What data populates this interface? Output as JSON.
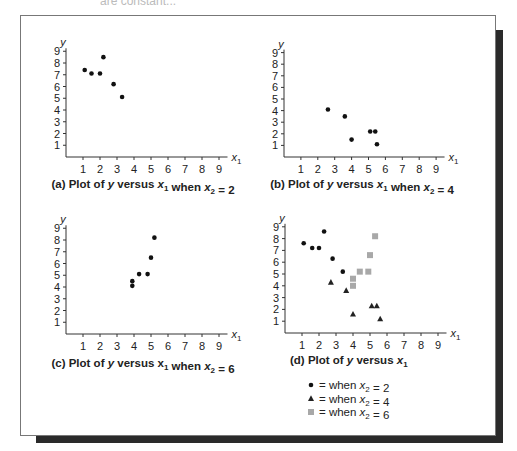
{
  "page": {
    "top_text": "are constant..."
  },
  "chart_data": [
    {
      "id": "a",
      "type": "scatter",
      "title": "(a) Plot of y versus x1 when x2 = 2",
      "caption_parts": [
        "(a) Plot of ",
        "y",
        " versus ",
        "x",
        "1",
        " when ",
        "x",
        "2",
        " = 2"
      ],
      "xlabel": "x1",
      "ylabel": "y",
      "xlim": [
        0,
        9.5
      ],
      "ylim": [
        0,
        9
      ],
      "xticks": [
        1,
        2,
        3,
        4,
        5,
        6,
        7,
        8,
        9
      ],
      "yticks": [
        1,
        2,
        3,
        4,
        5,
        6,
        7,
        8,
        9
      ],
      "grid": false,
      "series": [
        {
          "name": "x2 = 2",
          "marker": "circle",
          "color": "#111111",
          "points": [
            [
              1.1,
              7.4
            ],
            [
              1.5,
              7.1
            ],
            [
              2.0,
              7.1
            ],
            [
              2.2,
              8.5
            ],
            [
              2.8,
              6.2
            ],
            [
              3.3,
              5.1
            ]
          ]
        }
      ]
    },
    {
      "id": "b",
      "type": "scatter",
      "title": "(b) Plot of y versus x1 when x2 = 4",
      "caption_parts": [
        "(b) Plot of ",
        "y",
        " versus ",
        "x",
        "1",
        " when ",
        "x",
        "2",
        " = 4"
      ],
      "xlabel": "x1",
      "ylabel": "y",
      "xlim": [
        0,
        9.5
      ],
      "ylim": [
        0,
        9
      ],
      "xticks": [
        1,
        2,
        3,
        4,
        5,
        6,
        7,
        8,
        9
      ],
      "yticks": [
        1,
        2,
        3,
        4,
        5,
        6,
        7,
        8,
        9
      ],
      "grid": false,
      "series": [
        {
          "name": "x2 = 4",
          "marker": "circle",
          "color": "#111111",
          "points": [
            [
              2.6,
              4.1
            ],
            [
              3.6,
              3.5
            ],
            [
              4.0,
              1.5
            ],
            [
              5.1,
              2.2
            ],
            [
              5.4,
              2.2
            ],
            [
              5.5,
              1.1
            ]
          ]
        }
      ]
    },
    {
      "id": "c",
      "type": "scatter",
      "title": "(c) Plot of y versus x1 when x2 = 6",
      "caption_parts": [
        "(c) Plot of ",
        "y",
        " versus x",
        "",
        "1",
        " when ",
        "x",
        "2",
        " = 6"
      ],
      "xlabel": "x1",
      "ylabel": "y",
      "xlim": [
        0,
        9.5
      ],
      "ylim": [
        0,
        9
      ],
      "xticks": [
        1,
        2,
        3,
        4,
        5,
        6,
        7,
        8,
        9
      ],
      "yticks": [
        1,
        2,
        3,
        4,
        5,
        6,
        7,
        8,
        9
      ],
      "grid": false,
      "series": [
        {
          "name": "x2 = 6",
          "marker": "circle",
          "color": "#111111",
          "points": [
            [
              3.9,
              4.5
            ],
            [
              3.9,
              4.1
            ],
            [
              4.3,
              5.1
            ],
            [
              4.8,
              5.1
            ],
            [
              5.0,
              6.5
            ],
            [
              5.2,
              8.2
            ]
          ]
        }
      ]
    },
    {
      "id": "d",
      "type": "scatter",
      "title": "(d) Plot of y versus x1",
      "caption_parts": [
        "(d) Plot of ",
        "y",
        " versus ",
        "x",
        "1",
        "",
        "",
        "",
        ""
      ],
      "xlabel": "x1",
      "ylabel": "y",
      "xlim": [
        0,
        9.5
      ],
      "ylim": [
        0,
        9
      ],
      "xticks": [
        1,
        2,
        3,
        4,
        5,
        6,
        7,
        8,
        9
      ],
      "yticks": [
        1,
        2,
        3,
        4,
        5,
        6,
        7,
        8,
        9
      ],
      "grid": false,
      "legend_position": "bottom",
      "series": [
        {
          "name": "x2 = 2",
          "marker": "circle",
          "color": "#111111",
          "points": [
            [
              1.1,
              7.6
            ],
            [
              1.6,
              7.2
            ],
            [
              2.0,
              7.2
            ],
            [
              2.3,
              8.6
            ],
            [
              2.8,
              6.3
            ],
            [
              3.4,
              5.2
            ]
          ]
        },
        {
          "name": "x2 = 4",
          "marker": "triangle",
          "color": "#222222",
          "points": [
            [
              2.7,
              4.3
            ],
            [
              3.6,
              3.6
            ],
            [
              4.0,
              1.6
            ],
            [
              5.1,
              2.3
            ],
            [
              5.4,
              2.3
            ],
            [
              5.6,
              1.2
            ]
          ]
        },
        {
          "name": "x2 = 6",
          "marker": "square",
          "color": "#a8a8a8",
          "points": [
            [
              4.0,
              4.6
            ],
            [
              4.0,
              4.0
            ],
            [
              4.4,
              5.2
            ],
            [
              4.9,
              5.2
            ],
            [
              5.0,
              6.6
            ],
            [
              5.3,
              8.2
            ]
          ]
        }
      ],
      "legend": [
        {
          "marker": "circle",
          "text_parts": [
            "= when ",
            "x",
            "2",
            " = 2"
          ]
        },
        {
          "marker": "triangle",
          "text_parts": [
            "= when ",
            "x",
            "2",
            " = 4"
          ]
        },
        {
          "marker": "square",
          "text_parts": [
            "= when ",
            "x",
            "2",
            " = 6"
          ]
        }
      ]
    }
  ]
}
